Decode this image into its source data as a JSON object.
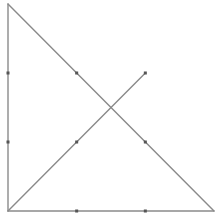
{
  "diagram": {
    "grid_units": 3,
    "colors": {
      "line": "#8a8a8a",
      "dot": "#555555",
      "background": "#ffffff"
    },
    "points": [
      {
        "id": "A",
        "x": 0,
        "y": 3
      },
      {
        "id": "B",
        "x": 0,
        "y": 0
      },
      {
        "id": "C",
        "x": 3,
        "y": 0
      },
      {
        "id": "D",
        "x": 2,
        "y": 2
      }
    ],
    "segments": [
      {
        "name": "left-leg",
        "from": [
          0,
          0
        ],
        "to": [
          0,
          3
        ]
      },
      {
        "name": "bottom-leg",
        "from": [
          0,
          0
        ],
        "to": [
          3,
          0
        ]
      },
      {
        "name": "hypotenuse",
        "from": [
          0,
          3
        ],
        "to": [
          3,
          0
        ]
      },
      {
        "name": "diagonal-segment",
        "from": [
          0,
          0
        ],
        "to": [
          2,
          2
        ]
      }
    ],
    "marks": [
      {
        "name": "left-leg-tick-1",
        "x": 0,
        "y": 1
      },
      {
        "name": "left-leg-tick-2",
        "x": 0,
        "y": 2
      },
      {
        "name": "bottom-leg-tick-1",
        "x": 1,
        "y": 0
      },
      {
        "name": "bottom-leg-tick-2",
        "x": 2,
        "y": 0
      },
      {
        "name": "hypotenuse-tick-1",
        "x": 1,
        "y": 2
      },
      {
        "name": "hypotenuse-tick-2",
        "x": 2,
        "y": 1
      },
      {
        "name": "diagonal-tick-1",
        "x": 1,
        "y": 1
      },
      {
        "name": "diagonal-endpoint",
        "x": 2,
        "y": 2
      }
    ]
  }
}
